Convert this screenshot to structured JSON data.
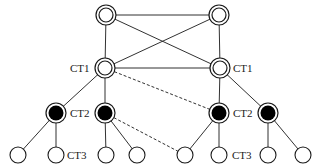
{
  "diagram": {
    "type": "hierarchical network topology",
    "colors": {
      "stroke": "#1a1a1a",
      "fill_white": "#ffffff",
      "fill_black": "#000000"
    },
    "nodes": [
      {
        "id": "top-left",
        "x": 106,
        "y": 15,
        "style": "double-ring"
      },
      {
        "id": "top-right",
        "x": 219,
        "y": 15,
        "style": "double-ring"
      },
      {
        "id": "ct1-left",
        "x": 105,
        "y": 68,
        "style": "double-ring",
        "label": "CT1"
      },
      {
        "id": "ct1-right",
        "x": 220,
        "y": 68,
        "style": "double-ring",
        "label": "CT1"
      },
      {
        "id": "ct2-left-a",
        "x": 56,
        "y": 113,
        "style": "black-ring",
        "label": "CT2"
      },
      {
        "id": "ct2-left-b",
        "x": 105,
        "y": 113,
        "style": "black-ring"
      },
      {
        "id": "ct2-right-a",
        "x": 219,
        "y": 113,
        "style": "black-ring",
        "label": "CT2"
      },
      {
        "id": "ct2-right-b",
        "x": 268,
        "y": 113,
        "style": "black-ring"
      },
      {
        "id": "leaf-1",
        "x": 18,
        "y": 155,
        "style": "plain"
      },
      {
        "id": "leaf-2",
        "x": 56,
        "y": 155,
        "style": "plain",
        "label": "CT3"
      },
      {
        "id": "leaf-3",
        "x": 106,
        "y": 155,
        "style": "plain"
      },
      {
        "id": "leaf-4",
        "x": 137,
        "y": 155,
        "style": "plain"
      },
      {
        "id": "leaf-5",
        "x": 185,
        "y": 155,
        "style": "plain"
      },
      {
        "id": "leaf-6",
        "x": 219,
        "y": 155,
        "style": "plain",
        "label": "CT3"
      },
      {
        "id": "leaf-7",
        "x": 268,
        "y": 155,
        "style": "plain"
      },
      {
        "id": "leaf-8",
        "x": 303,
        "y": 155,
        "style": "plain"
      }
    ],
    "edges": [
      {
        "from": "top-left",
        "to": "top-right",
        "style": "solid"
      },
      {
        "from": "top-left",
        "to": "ct1-left",
        "style": "solid"
      },
      {
        "from": "top-right",
        "to": "ct1-right",
        "style": "solid"
      },
      {
        "from": "top-left",
        "to": "ct1-right",
        "style": "solid"
      },
      {
        "from": "top-right",
        "to": "ct1-left",
        "style": "solid"
      },
      {
        "from": "ct1-left",
        "to": "ct1-right",
        "style": "solid"
      },
      {
        "from": "ct1-left",
        "to": "ct2-left-a",
        "style": "solid"
      },
      {
        "from": "ct1-left",
        "to": "ct2-left-b",
        "style": "solid"
      },
      {
        "from": "ct1-right",
        "to": "ct2-right-a",
        "style": "solid"
      },
      {
        "from": "ct1-right",
        "to": "ct2-right-b",
        "style": "solid"
      },
      {
        "from": "ct1-left",
        "to": "ct2-right-a",
        "style": "dashed"
      },
      {
        "from": "ct2-left-b",
        "to": "leaf-5",
        "style": "dashed"
      },
      {
        "from": "ct2-left-a",
        "to": "leaf-1",
        "style": "solid"
      },
      {
        "from": "ct2-left-a",
        "to": "leaf-2",
        "style": "solid"
      },
      {
        "from": "ct2-left-b",
        "to": "leaf-3",
        "style": "solid"
      },
      {
        "from": "ct2-left-b",
        "to": "leaf-4",
        "style": "solid"
      },
      {
        "from": "ct2-right-a",
        "to": "leaf-5",
        "style": "solid"
      },
      {
        "from": "ct2-right-a",
        "to": "leaf-6",
        "style": "solid"
      },
      {
        "from": "ct2-right-b",
        "to": "leaf-7",
        "style": "solid"
      },
      {
        "from": "ct2-right-b",
        "to": "leaf-8",
        "style": "solid"
      }
    ],
    "labels": [
      {
        "text": "CT1",
        "x": 70,
        "y": 72
      },
      {
        "text": "CT1",
        "x": 233,
        "y": 72
      },
      {
        "text": "CT2",
        "x": 70,
        "y": 117
      },
      {
        "text": "CT2",
        "x": 233,
        "y": 117
      },
      {
        "text": "CT3",
        "x": 67,
        "y": 159
      },
      {
        "text": "CT3",
        "x": 232,
        "y": 159
      }
    ]
  }
}
